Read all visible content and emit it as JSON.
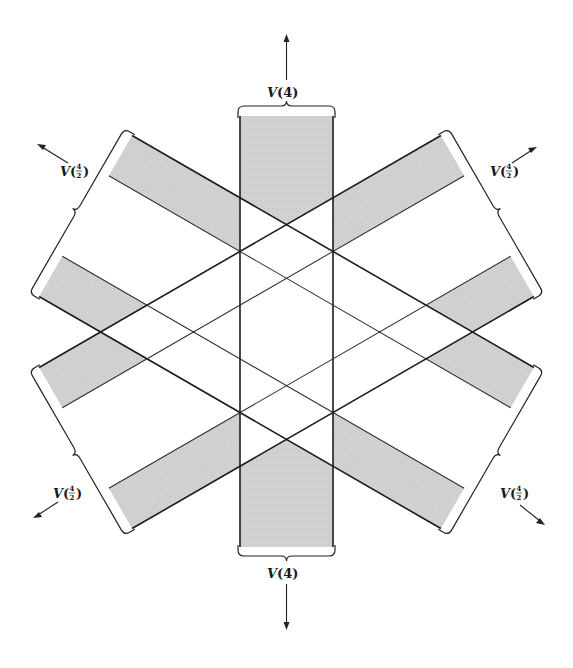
{
  "figure": {
    "shade_color": "#cfcfcf",
    "line_color": "#1c1c1c",
    "background": "#ffffff"
  },
  "labels": {
    "top": {
      "main": "V",
      "arg": "4"
    },
    "bottom": {
      "main": "V",
      "arg": "4"
    },
    "upper_left": {
      "main": "V",
      "num": "4",
      "den": "2"
    },
    "upper_right": {
      "main": "V",
      "num": "4",
      "den": "2"
    },
    "lower_left": {
      "main": "V",
      "num": "4",
      "den": "2"
    },
    "lower_right": {
      "main": "V",
      "num": "4",
      "den": "2"
    }
  }
}
